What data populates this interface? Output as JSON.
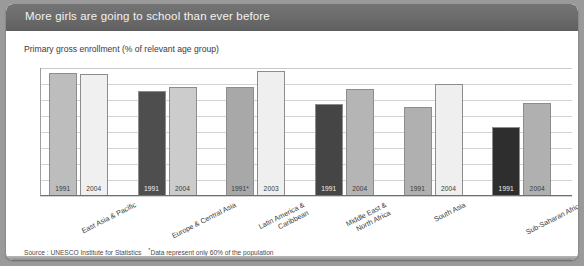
{
  "header": {
    "title": "More girls are going to school than ever before",
    "background_color": "#6b6b6b",
    "text_color": "#f2f2f2"
  },
  "subtitle": "Primary gross enrollment (% of relevant age group)",
  "footnote": {
    "source": "Source : UNESCO Institute for Statistics",
    "asterisk_marker": "*",
    "asterisk_note": "Data represent only 60% of the population"
  },
  "chart_data": {
    "type": "bar",
    "title": "More girls are going to school than ever before",
    "subtitle": "Primary gross enrollment (% of relevant age group)",
    "xlabel": "",
    "ylabel": "Primary gross enrollment (% of relevant age group)",
    "ylim": [
      0,
      120
    ],
    "yticks": [
      0,
      15,
      30,
      45,
      60,
      75,
      90,
      105,
      120
    ],
    "grid": true,
    "legend": "none",
    "categories": [
      "East Asia & Pacific",
      "Europe & Central Asia",
      "Latin America & Caribbean",
      "Middle East & North Africa",
      "South Asia",
      "Sub-Saharan Africa"
    ],
    "groups": [
      {
        "category": "East Asia & Pacific",
        "category_lines": [
          "East Asia & Pacific"
        ],
        "bars": [
          {
            "year_label": "1991",
            "value": 115,
            "color": "#bdbdbd",
            "label_color": "dark"
          },
          {
            "year_label": "2004",
            "value": 114,
            "color": "#f0f0f0",
            "label_color": "dark"
          }
        ]
      },
      {
        "category": "Europe & Central Asia",
        "category_lines": [
          "Europe & Central Asia"
        ],
        "bars": [
          {
            "year_label": "1991",
            "value": 98,
            "color": "#4e4e4e",
            "label_color": "light"
          },
          {
            "year_label": "2004",
            "value": 102,
            "color": "#cccccc",
            "label_color": "dark"
          }
        ]
      },
      {
        "category": "Latin America & Caribbean",
        "category_lines": [
          "Latin America &",
          "Caribbean"
        ],
        "bars": [
          {
            "year_label": "1991*",
            "value": 102,
            "color": "#a8a8a8",
            "label_color": "dark"
          },
          {
            "year_label": "2003",
            "value": 117,
            "color": "#efefef",
            "label_color": "dark"
          }
        ]
      },
      {
        "category": "Middle East & North Africa",
        "category_lines": [
          "Middle East &",
          "North Africa"
        ],
        "bars": [
          {
            "year_label": "1991",
            "value": 86,
            "color": "#454545",
            "label_color": "light"
          },
          {
            "year_label": "2004",
            "value": 100,
            "color": "#b5b5b5",
            "label_color": "dark"
          }
        ]
      },
      {
        "category": "South Asia",
        "category_lines": [
          "South Asia"
        ],
        "bars": [
          {
            "year_label": "1991",
            "value": 83,
            "color": "#b0b0b0",
            "label_color": "dark"
          },
          {
            "year_label": "2004",
            "value": 105,
            "color": "#efefef",
            "label_color": "dark"
          }
        ]
      },
      {
        "category": "Sub-Saharan Africa",
        "category_lines": [
          "Sub-Saharan Africa"
        ],
        "bars": [
          {
            "year_label": "1991",
            "value": 65,
            "color": "#2e2e2e",
            "label_color": "light"
          },
          {
            "year_label": "2004",
            "value": 87,
            "color": "#b0b0b0",
            "label_color": "dark"
          }
        ]
      }
    ]
  }
}
